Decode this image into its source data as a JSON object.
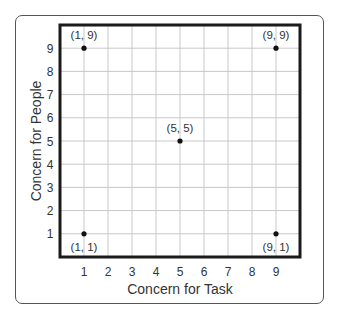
{
  "chart_data": {
    "type": "scatter",
    "title": "",
    "xlabel": "Concern for Task",
    "ylabel": "Concern for People",
    "xlim": [
      0,
      10
    ],
    "ylim": [
      0,
      10
    ],
    "grid": true,
    "x_ticks": [
      1,
      2,
      3,
      4,
      5,
      6,
      7,
      8,
      9
    ],
    "y_ticks": [
      1,
      2,
      3,
      4,
      5,
      6,
      7,
      8,
      9
    ],
    "points": [
      {
        "x": 1,
        "y": 9,
        "label": "(1, 9)",
        "label_pos": "above"
      },
      {
        "x": 9,
        "y": 9,
        "label": "(9, 9)",
        "label_pos": "above"
      },
      {
        "x": 5,
        "y": 5,
        "label": "(5, 5)",
        "label_pos": "above"
      },
      {
        "x": 1,
        "y": 1,
        "label": "(1, 1)",
        "label_pos": "below"
      },
      {
        "x": 9,
        "y": 1,
        "label": "(9, 1)",
        "label_pos": "below"
      }
    ],
    "colors": {
      "frame": "#1a1a1a",
      "grid": "#c8c8c8",
      "point": "#111111",
      "text": "#333333"
    }
  }
}
